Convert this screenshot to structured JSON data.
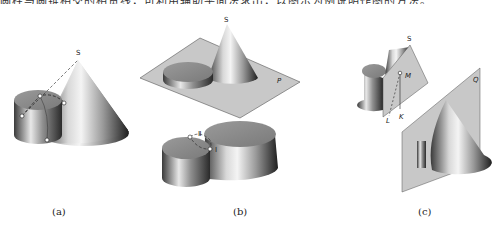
{
  "header": {
    "cropped_text": "圆柱与圆锥相交的相贯线，可利用辅助平面法求出，以图示为例说明作图的方法。"
  },
  "figure_a": {
    "caption": "(a)",
    "apex_label": "S"
  },
  "figure_b": {
    "caption": "(b)",
    "apex_label": "S",
    "plane_label": "P",
    "point_labels": [
      "Ⅱ",
      "Ⅰ"
    ]
  },
  "figure_c": {
    "caption": "(c)",
    "apex_label": "S",
    "point_labels": [
      "M",
      "L",
      "K"
    ],
    "plane_label": "Q"
  },
  "colors": {
    "background": "#ffffff",
    "plane_fill": "#c8c8c8",
    "cap_fill": "#8a8a8a",
    "shade_dark": "#2a2a2a",
    "shade_light": "#f2f2f2"
  }
}
